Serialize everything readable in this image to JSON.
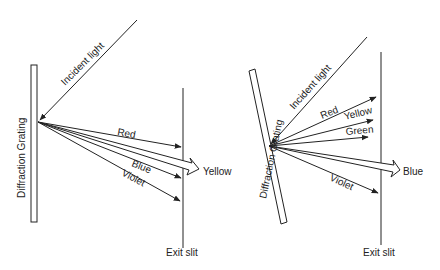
{
  "left_diagram": {
    "grating_label": "Diffraction Grating",
    "incident_label": "Incident light",
    "rays": {
      "red": "Red",
      "yellow": "Yellow",
      "blue": "Blue",
      "violet": "Violet"
    },
    "exit_label": "Exit slit"
  },
  "right_diagram": {
    "grating_label": "Diffraction Grating",
    "incident_label": "Incident light",
    "rays": {
      "red": "Red",
      "yellow": "Yellow",
      "green": "Green",
      "blue": "Blue",
      "violet": "Violet"
    },
    "exit_label": "Exit slit"
  },
  "colors": {
    "line": "#222222",
    "background": "#ffffff"
  }
}
